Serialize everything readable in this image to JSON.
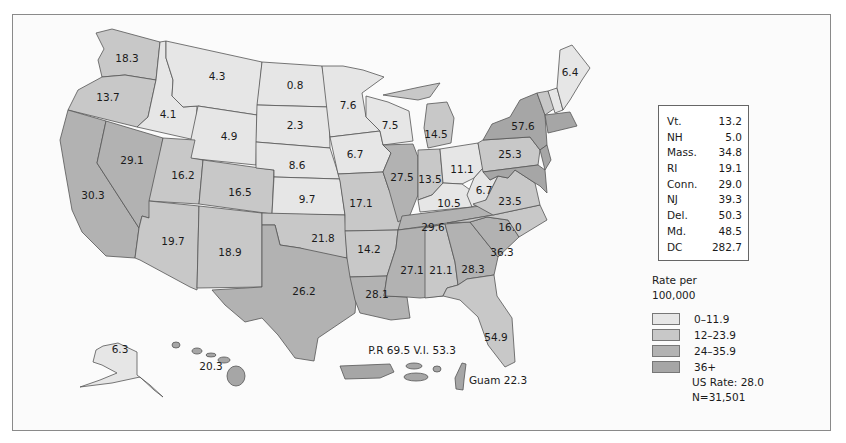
{
  "colors": {
    "bin0": "#e6e6e6",
    "bin1": "#c8c8c8",
    "bin2": "#b2b2b2",
    "bin3": "#a6a6a6",
    "frame": "#8a8a8a"
  },
  "small_states_table": {
    "rows": [
      {
        "state": "Vt.",
        "value": "13.2"
      },
      {
        "state": "NH",
        "value": "5.0"
      },
      {
        "state": "Mass.",
        "value": "34.8"
      },
      {
        "state": "RI",
        "value": "19.1"
      },
      {
        "state": "Conn.",
        "value": "29.0"
      },
      {
        "state": "NJ",
        "value": "39.3"
      },
      {
        "state": "Del.",
        "value": "50.3"
      },
      {
        "state": "Md.",
        "value": "48.5"
      },
      {
        "state": "DC",
        "value": "282.7"
      }
    ]
  },
  "legend": {
    "title_line1": "Rate per",
    "title_line2": "100,000",
    "bins": [
      {
        "label": "0–11.9",
        "color": "#e6e6e6"
      },
      {
        "label": "12–23.9",
        "color": "#c8c8c8"
      },
      {
        "label": "24–35.9",
        "color": "#b2b2b2"
      },
      {
        "label": "36+",
        "color": "#a6a6a6"
      }
    ],
    "us_rate": "US Rate: 28.0",
    "n": "N=31,501"
  },
  "territories": {
    "pr_vi": "P.R 69.5 V.I. 53.3",
    "guam": "Guam 22.3"
  },
  "states": {
    "WA": "18.3",
    "OR": "13.7",
    "CA": "30.3",
    "NV": "29.1",
    "ID": "4.1",
    "MT": "4.3",
    "WY": "4.9",
    "UT": "16.2",
    "CO": "16.5",
    "AZ": "19.7",
    "NM": "18.9",
    "ND": "0.8",
    "SD": "2.3",
    "NE": "8.6",
    "KS": "9.7",
    "OK": "21.8",
    "TX": "26.2",
    "MN": "7.6",
    "IA": "6.7",
    "MO": "17.1",
    "AR": "14.2",
    "LA": "28.1",
    "WI": "7.5",
    "IL": "27.5",
    "MI": "14.5",
    "IN": "13.5",
    "OH": "11.1",
    "KY": "10.5",
    "TN": "29.6",
    "MS": "27.1",
    "AL": "21.1",
    "GA": "28.3",
    "FL": "54.9",
    "SC": "36.3",
    "NC": "16.0",
    "VA": "23.5",
    "WV": "6.7",
    "PA": "25.3",
    "NY": "57.6",
    "ME": "6.4",
    "AK": "6.3",
    "HI": "20.3"
  }
}
